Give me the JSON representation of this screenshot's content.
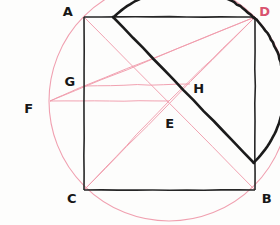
{
  "figure": {
    "width": 280,
    "height": 225,
    "background_color": "#fdfdfc",
    "ink_color": "#1b1b1b",
    "construction_color": "#f09dad",
    "construction_color_strong": "#ef8fa4"
  },
  "labels": {
    "A": "A",
    "B": "B",
    "C": "C",
    "D": "D",
    "E": "E",
    "F": "F",
    "G": "G",
    "H": "H"
  },
  "points": {
    "A": {
      "name": "A",
      "x": 84,
      "y": 17,
      "label_x": 68,
      "label_y": 11,
      "color": "#171717"
    },
    "D": {
      "name": "D",
      "x": 255,
      "y": 17,
      "label_x": 265,
      "label_y": 11,
      "color": "#d9536f"
    },
    "C": {
      "name": "C",
      "x": 84,
      "y": 190,
      "label_x": 72,
      "label_y": 198,
      "color": "#171717"
    },
    "B": {
      "name": "B",
      "x": 255,
      "y": 190,
      "label_x": 267,
      "label_y": 198,
      "color": "#171717"
    },
    "E": {
      "name": "E",
      "x": 169,
      "y": 101,
      "label_x": 170,
      "label_y": 123,
      "color": "#171717"
    },
    "F": {
      "name": "F",
      "x": 50,
      "y": 101,
      "label_x": 29,
      "label_y": 108,
      "color": "#171717"
    },
    "G": {
      "name": "G",
      "x": 84,
      "y": 86,
      "label_x": 70,
      "label_y": 81,
      "color": "#171717"
    },
    "H": {
      "name": "H",
      "x": 190,
      "y": 84,
      "label_x": 199,
      "label_y": 88,
      "color": "#171717"
    }
  },
  "square": {
    "name": "square-ADBC",
    "corners": [
      "A",
      "D",
      "B",
      "C"
    ],
    "left": 84,
    "top": 17,
    "right": 255,
    "bottom": 190,
    "stroke": "#262626",
    "stroke_width": 1.6
  },
  "semicircle": {
    "name": "black-semicircle",
    "diameter_start": {
      "x": 113,
      "y": 17
    },
    "diameter_end": {
      "x": 254,
      "y": 163
    },
    "center": {
      "x": 183.5,
      "y": 90
    },
    "radius": 101,
    "bulge": "left-down",
    "stroke": "#1b1b1b",
    "stroke_width": 2.6
  },
  "big_circle": {
    "name": "pink-construction-circle",
    "center": {
      "x": 169,
      "y": 101
    },
    "radius": 120,
    "stroke": "#f0a0b0",
    "stroke_width": 1.1
  },
  "construction_lines": [
    {
      "name": "line-A-to-B",
      "from": "A",
      "to": "B"
    },
    {
      "name": "line-C-to-D",
      "from": "C",
      "to": "D"
    },
    {
      "name": "line-F-to-D",
      "from": "F",
      "to": "D"
    },
    {
      "name": "line-G-to-D",
      "from": "G",
      "to": "D"
    },
    {
      "name": "line-F-to-E-horizontal",
      "from": "F",
      "to": "E"
    },
    {
      "name": "line-G-to-H-horizontal",
      "from": "G",
      "to": "H"
    },
    {
      "name": "line-F-to-G",
      "from": "F",
      "to": "G"
    },
    {
      "name": "line-E-to-C",
      "from": "E",
      "to": "C"
    },
    {
      "name": "line-E-to-D",
      "from": "E",
      "to": "D"
    }
  ]
}
